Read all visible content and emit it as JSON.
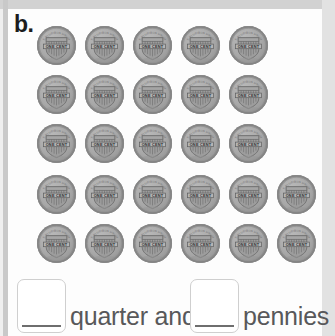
{
  "worksheet": {
    "problem_label": "b.",
    "coin_type": "penny",
    "coin_face_text": "ONE CENT",
    "coin_motto_text": "E PLURIBUS UNUM",
    "coin_count": 27,
    "coin_rows": [
      5,
      5,
      5,
      6,
      6
    ],
    "coin_color": "#a9a9a9",
    "answer_line": {
      "box1_value": "",
      "box1_placeholder": "",
      "text_after_box1": "quarter and",
      "box2_value": "",
      "box2_placeholder": "",
      "text_after_box2": "pennies"
    }
  },
  "coins": [
    {
      "row": 1,
      "col": 1,
      "x": 37,
      "y": 26
    },
    {
      "row": 1,
      "col": 2,
      "x": 85,
      "y": 26
    },
    {
      "row": 1,
      "col": 3,
      "x": 133,
      "y": 26
    },
    {
      "row": 1,
      "col": 4,
      "x": 181,
      "y": 26
    },
    {
      "row": 1,
      "col": 5,
      "x": 229,
      "y": 26
    },
    {
      "row": 2,
      "col": 1,
      "x": 37,
      "y": 75
    },
    {
      "row": 2,
      "col": 2,
      "x": 85,
      "y": 75
    },
    {
      "row": 2,
      "col": 3,
      "x": 133,
      "y": 75
    },
    {
      "row": 2,
      "col": 4,
      "x": 181,
      "y": 75
    },
    {
      "row": 2,
      "col": 5,
      "x": 229,
      "y": 75
    },
    {
      "row": 3,
      "col": 1,
      "x": 37,
      "y": 124
    },
    {
      "row": 3,
      "col": 2,
      "x": 85,
      "y": 124
    },
    {
      "row": 3,
      "col": 3,
      "x": 133,
      "y": 124
    },
    {
      "row": 3,
      "col": 4,
      "x": 181,
      "y": 124
    },
    {
      "row": 3,
      "col": 5,
      "x": 229,
      "y": 124
    },
    {
      "row": 4,
      "col": 1,
      "x": 37,
      "y": 175
    },
    {
      "row": 4,
      "col": 2,
      "x": 85,
      "y": 175
    },
    {
      "row": 4,
      "col": 3,
      "x": 133,
      "y": 175
    },
    {
      "row": 4,
      "col": 4,
      "x": 181,
      "y": 175
    },
    {
      "row": 4,
      "col": 5,
      "x": 229,
      "y": 175
    },
    {
      "row": 4,
      "col": 6,
      "x": 277,
      "y": 175
    },
    {
      "row": 5,
      "col": 1,
      "x": 37,
      "y": 224
    },
    {
      "row": 5,
      "col": 2,
      "x": 85,
      "y": 224
    },
    {
      "row": 5,
      "col": 3,
      "x": 133,
      "y": 224
    },
    {
      "row": 5,
      "col": 4,
      "x": 181,
      "y": 224
    },
    {
      "row": 5,
      "col": 5,
      "x": 229,
      "y": 224
    },
    {
      "row": 5,
      "col": 6,
      "x": 277,
      "y": 224
    }
  ]
}
